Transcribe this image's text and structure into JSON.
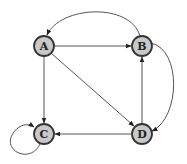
{
  "diagram": {
    "type": "directed-graph",
    "node_fill": "#c8c8c8",
    "node_stroke": "#333333",
    "edge_color": "#555555",
    "nodes": [
      {
        "id": "A",
        "label": "A",
        "x": 44,
        "y": 46
      },
      {
        "id": "B",
        "label": "B",
        "x": 142,
        "y": 46
      },
      {
        "id": "C",
        "label": "C",
        "x": 44,
        "y": 134
      },
      {
        "id": "D",
        "label": "D",
        "x": 142,
        "y": 134
      }
    ],
    "edges": [
      {
        "from": "A",
        "to": "B"
      },
      {
        "from": "A",
        "to": "C"
      },
      {
        "from": "A",
        "to": "D"
      },
      {
        "from": "B",
        "to": "A",
        "curved": true
      },
      {
        "from": "B",
        "to": "D",
        "curved": true
      },
      {
        "from": "D",
        "to": "B"
      },
      {
        "from": "D",
        "to": "C"
      },
      {
        "from": "C",
        "to": "C",
        "self_loop": true
      }
    ]
  }
}
